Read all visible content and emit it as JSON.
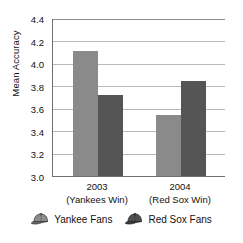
{
  "chart_data": {
    "type": "bar",
    "title": "",
    "xlabel": "",
    "ylabel": "Mean Accuracy",
    "ylim": [
      3.0,
      4.4
    ],
    "ytick_labels": [
      "4.4",
      "4.2",
      "4.0",
      "3.8",
      "3.6",
      "3.4",
      "3.2",
      "3.0"
    ],
    "ytick_values": [
      4.4,
      4.2,
      4.0,
      3.8,
      3.6,
      3.4,
      3.2,
      3.0
    ],
    "grid": true,
    "legend_position": "bottom",
    "categories": [
      "2003",
      "2004"
    ],
    "category_sublabels": [
      "(Yankees Win)",
      "(Red Sox Win)"
    ],
    "series": [
      {
        "name": "Yankee Fans",
        "color": "#8a8a8a",
        "icon": "baseball-cap-icon",
        "values": [
          4.11,
          3.54
        ]
      },
      {
        "name": "Red Sox Fans",
        "color": "#555555",
        "icon": "baseball-cap-icon",
        "values": [
          3.72,
          3.84
        ]
      }
    ]
  },
  "axis": {
    "y_title": "Mean Accuracy",
    "tick_0": "4.4",
    "tick_1": "4.2",
    "tick_2": "4.0",
    "tick_3": "3.8",
    "tick_4": "3.6",
    "tick_5": "3.4",
    "tick_6": "3.2",
    "tick_7": "3.0"
  },
  "x_axis": {
    "group_0_year": "2003",
    "group_0_sub": "(Yankees Win)",
    "group_1_year": "2004",
    "group_1_sub": "(Red Sox Win)"
  },
  "legend": {
    "item_0_label": "Yankee Fans",
    "item_1_label": "Red Sox Fans"
  },
  "colors": {
    "series_light": "#8a8a8a",
    "series_dark": "#555555",
    "gridline": "#b9b9b9",
    "axis": "#6f6f6f",
    "text": "#111111",
    "background": "#ffffff"
  }
}
